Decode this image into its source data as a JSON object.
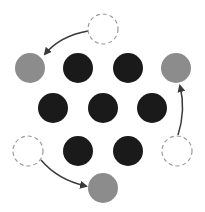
{
  "diagram": {
    "colors": {
      "background": "#ffffff",
      "filled": "#1a1a1a",
      "moved": "#8c8c8c",
      "empty_stroke": "#9a9a9a",
      "arrow": "#3a3a3a"
    },
    "radius": 15,
    "filled_circles": [
      {
        "id": "r1c2",
        "cx": 78,
        "cy": 68
      },
      {
        "id": "r1c3",
        "cx": 128,
        "cy": 68
      },
      {
        "id": "r2c1",
        "cx": 53,
        "cy": 108
      },
      {
        "id": "r2c2",
        "cx": 103,
        "cy": 108
      },
      {
        "id": "r2c3",
        "cx": 152,
        "cy": 108
      },
      {
        "id": "r3c2",
        "cx": 78,
        "cy": 151
      },
      {
        "id": "r3c3",
        "cx": 128,
        "cy": 151
      }
    ],
    "moved_circles": [
      {
        "id": "left-top",
        "cx": 30,
        "cy": 68
      },
      {
        "id": "right-top",
        "cx": 176,
        "cy": 68
      },
      {
        "id": "bottom",
        "cx": 103,
        "cy": 188
      }
    ],
    "empty_circles": [
      {
        "id": "top",
        "cx": 103,
        "cy": 29
      },
      {
        "id": "left-bottom",
        "cx": 28,
        "cy": 151
      },
      {
        "id": "right-bottom",
        "cx": 177,
        "cy": 151
      }
    ],
    "arrows": [
      {
        "from": "top",
        "to": "left-top",
        "path": "M88,31 Q60,36 45,54"
      },
      {
        "from": "right-bottom",
        "to": "right-top",
        "path": "M178,135 Q186,110 180,86"
      },
      {
        "from": "left-bottom",
        "to": "bottom",
        "path": "M41,160 Q58,180 86,186"
      }
    ]
  }
}
